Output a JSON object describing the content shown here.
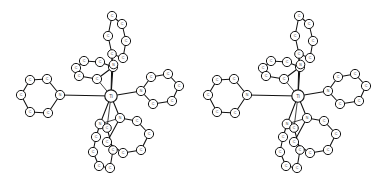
{
  "figure": {
    "kind": "stereo-pair",
    "background_color": "#ffffff",
    "line_color": "#111111",
    "atom_fill_color": "#ffffff",
    "label_color": "#3a3a3a",
    "width": 374,
    "height": 181,
    "views": [
      {
        "name": "left-eye-view",
        "offset_x": 0
      },
      {
        "name": "right-eye-view",
        "offset_x": 187
      }
    ]
  },
  "molecule": {
    "center_label": "Ti",
    "atoms": [
      {
        "id": "M",
        "label": "Ti",
        "x": 111.0,
        "y": 96.0,
        "r": 6.2,
        "font": 4.6,
        "kind": "metal"
      },
      {
        "id": "N1",
        "label": "N",
        "x": 60.0,
        "y": 95.0,
        "r": 4.6,
        "font": 3.6,
        "kind": "hetero"
      },
      {
        "id": "C11",
        "label": "C",
        "x": 47.0,
        "y": 79.0,
        "r": 4.6,
        "font": 3.6,
        "kind": "carbon"
      },
      {
        "id": "C12",
        "label": "C",
        "x": 30.0,
        "y": 80.0,
        "r": 4.6,
        "font": 3.6,
        "kind": "carbon"
      },
      {
        "id": "C13",
        "label": "C",
        "x": 21.0,
        "y": 95.0,
        "r": 4.6,
        "font": 3.6,
        "kind": "carbon"
      },
      {
        "id": "C14",
        "label": "C",
        "x": 30.0,
        "y": 112.0,
        "r": 4.6,
        "font": 3.6,
        "kind": "carbon"
      },
      {
        "id": "C15",
        "label": "C",
        "x": 48.0,
        "y": 113.0,
        "r": 4.6,
        "font": 3.6,
        "kind": "carbon"
      },
      {
        "id": "N2",
        "label": "N",
        "x": 141.0,
        "y": 91.0,
        "r": 4.6,
        "font": 3.6,
        "kind": "hetero"
      },
      {
        "id": "C21",
        "label": "C",
        "x": 151.0,
        "y": 77.0,
        "r": 4.6,
        "font": 3.6,
        "kind": "carbon"
      },
      {
        "id": "C22",
        "label": "C",
        "x": 168.0,
        "y": 74.0,
        "r": 4.6,
        "font": 3.6,
        "kind": "carbon"
      },
      {
        "id": "C23",
        "label": "C",
        "x": 179.0,
        "y": 86.0,
        "r": 4.6,
        "font": 3.6,
        "kind": "carbon"
      },
      {
        "id": "C24",
        "label": "C",
        "x": 172.0,
        "y": 101.0,
        "r": 4.6,
        "font": 3.6,
        "kind": "carbon"
      },
      {
        "id": "C25",
        "label": "C",
        "x": 153.0,
        "y": 104.0,
        "r": 4.6,
        "font": 3.6,
        "kind": "carbon"
      },
      {
        "id": "N3",
        "label": "N",
        "x": 113.0,
        "y": 67.0,
        "r": 4.6,
        "font": 3.6,
        "kind": "hetero"
      },
      {
        "id": "C31",
        "label": "C",
        "x": 100.0,
        "y": 62.0,
        "r": 4.6,
        "font": 3.6,
        "kind": "carbon"
      },
      {
        "id": "C32",
        "label": "C",
        "x": 84.0,
        "y": 61.0,
        "r": 4.6,
        "font": 3.6,
        "kind": "carbon"
      },
      {
        "id": "C33",
        "label": "C",
        "x": 76.0,
        "y": 68.0,
        "r": 4.6,
        "font": 3.6,
        "kind": "carbon"
      },
      {
        "id": "C34",
        "label": "C",
        "x": 79.0,
        "y": 76.0,
        "r": 4.6,
        "font": 3.6,
        "kind": "carbon"
      },
      {
        "id": "C35",
        "label": "C",
        "x": 97.0,
        "y": 79.0,
        "r": 4.6,
        "font": 3.6,
        "kind": "carbon"
      },
      {
        "id": "N4",
        "label": "N",
        "x": 113.5,
        "y": 64.5,
        "r": 4.3,
        "font": 3.4,
        "kind": "hetero"
      },
      {
        "id": "C41",
        "label": "C",
        "x": 123.0,
        "y": 58.0,
        "r": 4.6,
        "font": 3.6,
        "kind": "carbon"
      },
      {
        "id": "C42",
        "label": "C",
        "x": 126.0,
        "y": 41.0,
        "r": 4.6,
        "font": 3.6,
        "kind": "carbon"
      },
      {
        "id": "C43",
        "label": "C",
        "x": 122.0,
        "y": 24.0,
        "r": 4.6,
        "font": 3.6,
        "kind": "carbon"
      },
      {
        "id": "C44",
        "label": "C",
        "x": 112.0,
        "y": 16.0,
        "r": 4.6,
        "font": 3.6,
        "kind": "carbon"
      },
      {
        "id": "C45",
        "label": "C",
        "x": 108.0,
        "y": 36.0,
        "r": 4.6,
        "font": 3.6,
        "kind": "carbon"
      },
      {
        "id": "C46",
        "label": "C",
        "x": 112.0,
        "y": 54.0,
        "r": 4.3,
        "font": 3.4,
        "kind": "carbon"
      },
      {
        "id": "N5",
        "label": "N",
        "x": 120.0,
        "y": 118.0,
        "r": 4.6,
        "font": 3.6,
        "kind": "hetero"
      },
      {
        "id": "C51",
        "label": "C",
        "x": 137.0,
        "y": 121.0,
        "r": 4.6,
        "font": 3.6,
        "kind": "carbon"
      },
      {
        "id": "C52",
        "label": "C",
        "x": 149.0,
        "y": 134.0,
        "r": 4.6,
        "font": 3.6,
        "kind": "carbon"
      },
      {
        "id": "C53",
        "label": "C",
        "x": 141.0,
        "y": 150.0,
        "r": 4.6,
        "font": 3.6,
        "kind": "carbon"
      },
      {
        "id": "C54",
        "label": "C",
        "x": 123.0,
        "y": 153.0,
        "r": 4.6,
        "font": 3.6,
        "kind": "carbon"
      },
      {
        "id": "C55",
        "label": "C",
        "x": 107.0,
        "y": 142.0,
        "r": 4.6,
        "font": 3.6,
        "kind": "carbon"
      },
      {
        "id": "N6",
        "label": "N",
        "x": 100.0,
        "y": 124.0,
        "r": 4.8,
        "font": 3.6,
        "kind": "hetero"
      },
      {
        "id": "C61",
        "label": "C",
        "x": 96.0,
        "y": 137.0,
        "r": 4.6,
        "font": 3.6,
        "kind": "carbon"
      },
      {
        "id": "C62",
        "label": "C",
        "x": 93.0,
        "y": 152.0,
        "r": 4.6,
        "font": 3.6,
        "kind": "carbon"
      },
      {
        "id": "C63",
        "label": "C",
        "x": 99.0,
        "y": 166.0,
        "r": 4.6,
        "font": 3.6,
        "kind": "carbon"
      },
      {
        "id": "C64",
        "label": "C",
        "x": 110.0,
        "y": 168.0,
        "r": 4.6,
        "font": 3.6,
        "kind": "carbon"
      },
      {
        "id": "C65",
        "label": "C",
        "x": 113.0,
        "y": 150.0,
        "r": 4.3,
        "font": 3.4,
        "kind": "carbon"
      },
      {
        "id": "C66",
        "label": "C",
        "x": 107.0,
        "y": 128.0,
        "r": 4.3,
        "font": 3.4,
        "kind": "carbon"
      }
    ],
    "bonds": [
      {
        "from": "M",
        "to": "N1",
        "weight": "thick"
      },
      {
        "from": "M",
        "to": "N2",
        "weight": "thick"
      },
      {
        "from": "M",
        "to": "N3",
        "weight": "thick"
      },
      {
        "from": "M",
        "to": "N5",
        "weight": "thick"
      },
      {
        "from": "M",
        "to": "N6",
        "weight": "thick"
      },
      {
        "from": "M",
        "to": "C46",
        "weight": "thick"
      },
      {
        "from": "N1",
        "to": "C11",
        "weight": "thick"
      },
      {
        "from": "C11",
        "to": "C12",
        "weight": "thick"
      },
      {
        "from": "C12",
        "to": "C13",
        "weight": "thick"
      },
      {
        "from": "C13",
        "to": "C14",
        "weight": "thick"
      },
      {
        "from": "C14",
        "to": "C15",
        "weight": "thick"
      },
      {
        "from": "C15",
        "to": "N1",
        "weight": "thick"
      },
      {
        "from": "N2",
        "to": "C21",
        "weight": "thick"
      },
      {
        "from": "C21",
        "to": "C22",
        "weight": "thick"
      },
      {
        "from": "C22",
        "to": "C23",
        "weight": "thick"
      },
      {
        "from": "C23",
        "to": "C24",
        "weight": "thick"
      },
      {
        "from": "C24",
        "to": "C25",
        "weight": "thick"
      },
      {
        "from": "C25",
        "to": "N2",
        "weight": "thick"
      },
      {
        "from": "N3",
        "to": "C31",
        "weight": "thick"
      },
      {
        "from": "C31",
        "to": "C32",
        "weight": "thick"
      },
      {
        "from": "C32",
        "to": "C33",
        "weight": "thick"
      },
      {
        "from": "C33",
        "to": "C34",
        "weight": "thick"
      },
      {
        "from": "C34",
        "to": "C35",
        "weight": "thick"
      },
      {
        "from": "C35",
        "to": "N3",
        "weight": "thick"
      },
      {
        "from": "C35",
        "to": "M",
        "weight": "thin"
      },
      {
        "from": "C46",
        "to": "C41",
        "weight": "thick"
      },
      {
        "from": "C41",
        "to": "C42",
        "weight": "thick"
      },
      {
        "from": "C42",
        "to": "C43",
        "weight": "thick"
      },
      {
        "from": "C43",
        "to": "C44",
        "weight": "thick"
      },
      {
        "from": "C44",
        "to": "C45",
        "weight": "thick"
      },
      {
        "from": "C45",
        "to": "C46",
        "weight": "thick"
      },
      {
        "from": "C46",
        "to": "N3",
        "weight": "thin"
      },
      {
        "from": "N5",
        "to": "C51",
        "weight": "thick"
      },
      {
        "from": "C51",
        "to": "C52",
        "weight": "thick"
      },
      {
        "from": "C52",
        "to": "C53",
        "weight": "thick"
      },
      {
        "from": "C53",
        "to": "C54",
        "weight": "thick"
      },
      {
        "from": "C54",
        "to": "C55",
        "weight": "thick"
      },
      {
        "from": "C55",
        "to": "N5",
        "weight": "thick"
      },
      {
        "from": "N5",
        "to": "N6",
        "weight": "thin"
      },
      {
        "from": "N6",
        "to": "C61",
        "weight": "thick"
      },
      {
        "from": "C61",
        "to": "C62",
        "weight": "thick"
      },
      {
        "from": "C62",
        "to": "C63",
        "weight": "thick"
      },
      {
        "from": "C63",
        "to": "C64",
        "weight": "thick"
      },
      {
        "from": "C64",
        "to": "C65",
        "weight": "thick"
      },
      {
        "from": "C65",
        "to": "C66",
        "weight": "thick"
      },
      {
        "from": "C66",
        "to": "N6",
        "weight": "thin"
      },
      {
        "from": "C65",
        "to": "C55",
        "weight": "thin"
      },
      {
        "from": "C66",
        "to": "M",
        "weight": "thin"
      }
    ]
  }
}
